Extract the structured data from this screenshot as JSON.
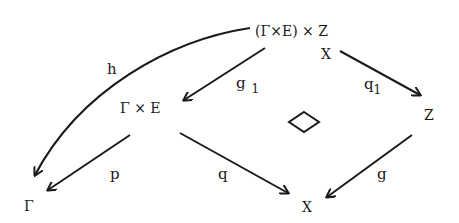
{
  "diagram": {
    "type": "commutative-diagram",
    "nodes": {
      "top": "(Γ×E) × Z",
      "top_under": "X",
      "gamma_e": "Γ × E",
      "z": "Z",
      "gamma": "Γ",
      "x": "X"
    },
    "arrows": {
      "h": {
        "label": "h",
        "from": "(Γ×E) × Z",
        "to": "Γ"
      },
      "g1": {
        "label": "g",
        "sub": "1",
        "from": "(Γ×E) × Z",
        "to": "Γ × E"
      },
      "q1": {
        "label": "q",
        "sub": "1",
        "from": "(Γ×E) × Z",
        "to": "Z"
      },
      "p": {
        "label": "p",
        "from": "Γ × E",
        "to": "Γ"
      },
      "q": {
        "label": "q",
        "from": "Γ × E",
        "to": "X"
      },
      "g": {
        "label": "g",
        "from": "Z",
        "to": "X"
      }
    },
    "center_symbol": "◇",
    "colors": {
      "ink": "#1a1a1a",
      "background": "#ffffff"
    }
  }
}
